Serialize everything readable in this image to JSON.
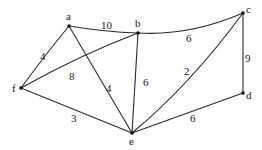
{
  "graph": {
    "nodes": [
      {
        "id": "a",
        "label": "a",
        "x": 69,
        "y": 26,
        "lx": 66,
        "ly": 20
      },
      {
        "id": "b",
        "label": "b",
        "x": 138,
        "y": 33,
        "lx": 135,
        "ly": 27
      },
      {
        "id": "c",
        "label": "c",
        "x": 243,
        "y": 13,
        "lx": 246,
        "ly": 13
      },
      {
        "id": "d",
        "label": "d",
        "x": 243,
        "y": 93,
        "lx": 246,
        "ly": 99
      },
      {
        "id": "e",
        "label": "e",
        "x": 132,
        "y": 133,
        "lx": 129,
        "ly": 145
      },
      {
        "id": "f",
        "label": "f",
        "x": 21,
        "y": 88,
        "lx": 12,
        "ly": 92
      }
    ],
    "edges": [
      {
        "from": "a",
        "to": "b",
        "weight": "10",
        "lx": 101,
        "ly": 29
      },
      {
        "from": "b",
        "to": "c",
        "weight": "6",
        "lx": 186,
        "ly": 42
      },
      {
        "from": "a",
        "to": "f",
        "weight": "4",
        "lx": 40,
        "ly": 60
      },
      {
        "from": "f",
        "to": "b",
        "weight": "8",
        "lx": 69,
        "ly": 80
      },
      {
        "from": "a",
        "to": "e",
        "weight": "4",
        "lx": 106,
        "ly": 92
      },
      {
        "from": "b",
        "to": "e",
        "weight": "6",
        "lx": 143,
        "ly": 86
      },
      {
        "from": "c",
        "to": "e",
        "weight": "2",
        "lx": 184,
        "ly": 75
      },
      {
        "from": "c",
        "to": "d",
        "weight": "9",
        "lx": 245,
        "ly": 62
      },
      {
        "from": "f",
        "to": "e",
        "weight": "3",
        "lx": 71,
        "ly": 122
      },
      {
        "from": "e",
        "to": "d",
        "weight": "6",
        "lx": 190,
        "ly": 122
      }
    ]
  }
}
